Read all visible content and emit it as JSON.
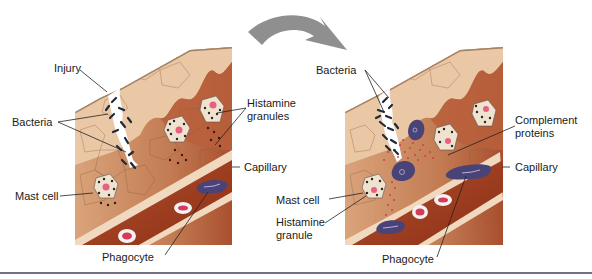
{
  "figure": {
    "transition_arrow": {
      "icon": "curved-arrow-icon",
      "color": "#8f8f8f"
    },
    "colors": {
      "epidermis_light": "#e9c4a4",
      "tissue_mid": "#c98a63",
      "tissue_dark": "#a9502f",
      "capillary_wall": "#eed8c0",
      "blood": "#9a3a1e",
      "bacteria": "#1e2a3a",
      "phagocyte": "#4a4378",
      "complement": "#e0304a",
      "rbc": "#f2f2f2",
      "rbc_center": "#d63a5a",
      "mast_cell": "#efe3cf",
      "rule": "#6f6f8a"
    },
    "left_panel": {
      "labels": {
        "injury": "Injury",
        "bacteria": "Bacteria",
        "histamine_granules_line1": "Histamine",
        "histamine_granules_line2": "granules",
        "capillary": "Capillary",
        "mast_cell": "Mast cell",
        "phagocyte": "Phagocyte"
      }
    },
    "right_panel": {
      "labels": {
        "bacteria": "Bacteria",
        "complement_line1": "Complement",
        "complement_line2": "proteins",
        "capillary": "Capillary",
        "mast_cell": "Mast cell",
        "histamine_granule_line1": "Histamine",
        "histamine_granule_line2": "granule",
        "phagocyte": "Phagocyte"
      }
    }
  }
}
